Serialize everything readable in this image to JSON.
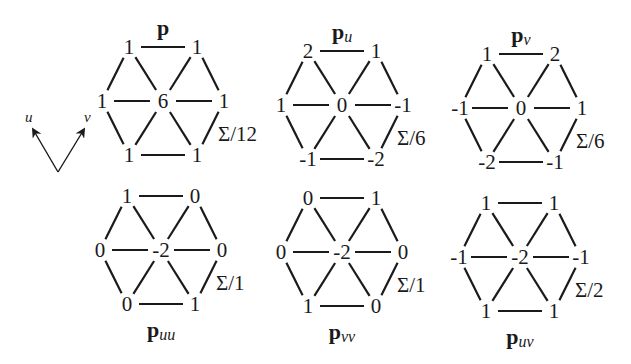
{
  "axes": {
    "u_label": "u",
    "v_label": "v"
  },
  "stencils": [
    {
      "id": "p",
      "title_main": "p",
      "title_sub": "",
      "title_position": "top",
      "normalizer": "Σ/12",
      "values": {
        "top_left": "1",
        "top_right": "1",
        "left": "1",
        "center": "6",
        "right": "1",
        "bottom_left": "1",
        "bottom_right": "1"
      }
    },
    {
      "id": "pu",
      "title_main": "p",
      "title_sub": "u",
      "title_position": "top",
      "normalizer": "Σ/6",
      "values": {
        "top_left": "2",
        "top_right": "1",
        "left": "1",
        "center": "0",
        "right": "-1",
        "bottom_left": "-1",
        "bottom_right": "-2"
      }
    },
    {
      "id": "pv",
      "title_main": "p",
      "title_sub": "v",
      "title_position": "top",
      "normalizer": "Σ/6",
      "values": {
        "top_left": "1",
        "top_right": "2",
        "left": "-1",
        "center": "0",
        "right": "1",
        "bottom_left": "-2",
        "bottom_right": "-1"
      }
    },
    {
      "id": "puu",
      "title_main": "p",
      "title_sub": "uu",
      "title_position": "bottom",
      "normalizer": "Σ/1",
      "values": {
        "top_left": "1",
        "top_right": "0",
        "left": "0",
        "center": "-2",
        "right": "0",
        "bottom_left": "0",
        "bottom_right": "1"
      }
    },
    {
      "id": "pvv",
      "title_main": "p",
      "title_sub": "vv",
      "title_position": "bottom",
      "normalizer": "Σ/1",
      "values": {
        "top_left": "0",
        "top_right": "1",
        "left": "0",
        "center": "-2",
        "right": "0",
        "bottom_left": "1",
        "bottom_right": "0"
      }
    },
    {
      "id": "puv",
      "title_main": "p",
      "title_sub": "uv",
      "title_position": "bottom",
      "normalizer": "Σ/2",
      "values": {
        "top_left": "1",
        "top_right": "1",
        "left": "-1",
        "center": "-2",
        "right": "-1",
        "bottom_left": "1",
        "bottom_right": "1"
      }
    }
  ]
}
